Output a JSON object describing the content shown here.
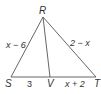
{
  "diagram": {
    "vertices": {
      "R": {
        "label": "R",
        "x": 43,
        "y": 17
      },
      "S": {
        "label": "S",
        "x": 11,
        "y": 77
      },
      "V": {
        "label": "V",
        "x": 50,
        "y": 77
      },
      "T": {
        "label": "T",
        "x": 96,
        "y": 77
      }
    },
    "side_labels": {
      "RS": "x − 6",
      "RT": "2 − x",
      "SV": "3",
      "VT": "x + 2"
    },
    "line_color": "#555555"
  }
}
